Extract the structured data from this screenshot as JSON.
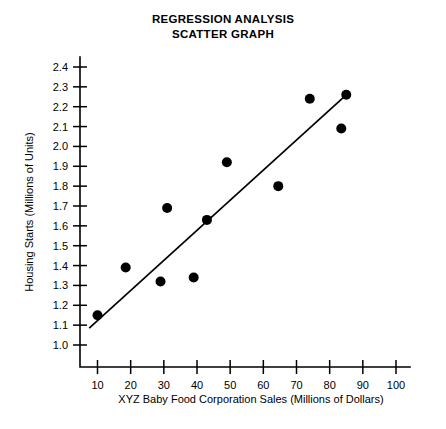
{
  "title": {
    "line1": "REGRESSION ANALYSIS",
    "line2": "SCATTER GRAPH"
  },
  "chart_data": {
    "type": "scatter",
    "title": "REGRESSION ANALYSIS SCATTER GRAPH",
    "xlabel": "XYZ Baby Food Corporation Sales (Millions of Dollars)",
    "ylabel": "Housing Starts (Millions of Units)",
    "xlim": [
      0,
      105
    ],
    "ylim": [
      0.95,
      2.45
    ],
    "grid": false,
    "legend": "none",
    "xticks": [
      10,
      20,
      30,
      40,
      50,
      60,
      70,
      80,
      90,
      100
    ],
    "xtick_labels": [
      "10",
      "20",
      "30",
      "40",
      "50",
      "60",
      "70",
      "80",
      "90",
      "100"
    ],
    "yticks": [
      1.0,
      1.1,
      1.2,
      1.3,
      1.4,
      1.5,
      1.6,
      1.7,
      1.8,
      1.9,
      2.0,
      2.1,
      2.2,
      2.3,
      2.4
    ],
    "ytick_labels": [
      "1.0",
      "1.1",
      "1.2",
      "1.3",
      "1.4",
      "1.5",
      "1.6",
      "1.7",
      "1.8",
      "1.9",
      "2.0",
      "2.1",
      "2.2",
      "2.3",
      "2.4"
    ],
    "x": [
      10,
      18.5,
      29,
      31,
      39,
      43,
      49,
      64.5,
      74,
      83.5,
      85
    ],
    "y": [
      1.15,
      1.39,
      1.32,
      1.69,
      1.34,
      1.63,
      1.92,
      1.8,
      2.24,
      2.09,
      2.26
    ],
    "points": [
      {
        "x": 10,
        "y": 1.15
      },
      {
        "x": 18.5,
        "y": 1.39
      },
      {
        "x": 29,
        "y": 1.32
      },
      {
        "x": 31,
        "y": 1.69
      },
      {
        "x": 39,
        "y": 1.34
      },
      {
        "x": 43,
        "y": 1.63
      },
      {
        "x": 49,
        "y": 1.92
      },
      {
        "x": 64.5,
        "y": 1.8
      },
      {
        "x": 74,
        "y": 2.24
      },
      {
        "x": 83.5,
        "y": 2.09
      },
      {
        "x": 85,
        "y": 2.26
      }
    ],
    "trendline": {
      "type": "linear-regression",
      "x_start": 7.5,
      "y_start": 1.085,
      "x_end": 85,
      "y_end": 2.26
    }
  }
}
